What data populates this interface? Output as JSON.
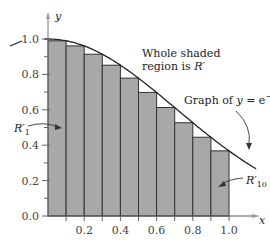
{
  "chart_data": {
    "type": "bar",
    "title": "",
    "xlabel": "x",
    "ylabel": "y",
    "xlim": [
      0,
      1.0
    ],
    "ylim": [
      0,
      1.0
    ],
    "x_ticks": [
      "0.2",
      "0.4",
      "0.6",
      "0.8",
      "1.0"
    ],
    "y_ticks": [
      "0.0",
      "0.2",
      "0.4",
      "0.6",
      "0.8",
      "1.0"
    ],
    "grid": false,
    "curve": {
      "label": "Graph of y = e^{-x^2}",
      "function": "exp(-x^2)"
    },
    "categories": [
      "0.0-0.1",
      "0.1-0.2",
      "0.2-0.3",
      "0.3-0.4",
      "0.4-0.5",
      "0.5-0.6",
      "0.6-0.7",
      "0.7-0.8",
      "0.8-0.9",
      "0.9-1.0"
    ],
    "values": [
      0.99,
      0.961,
      0.914,
      0.852,
      0.779,
      0.698,
      0.613,
      0.527,
      0.445,
      0.368
    ],
    "annotations": [
      {
        "text": "Whole shaded region is R'",
        "target": "all rectangles"
      },
      {
        "text": "Graph of y = e^{-x^2}",
        "target": "curve"
      },
      {
        "text": "R'_1",
        "target": "first rectangle"
      },
      {
        "text": "R'_10",
        "target": "last rectangle"
      }
    ]
  },
  "labels": {
    "x_axis": "x",
    "y_axis": "y",
    "region_line1": "Whole shaded",
    "region_line2": "region is ",
    "region_R": "R′",
    "graph_prefix": "Graph of ",
    "graph_y": "y",
    "graph_eq": " = e",
    "graph_exp": "−x²",
    "r1": "R′",
    "r1_sub": "1",
    "r10": "R′",
    "r10_sub": "10"
  },
  "colors": {
    "bar_fill": "#a8a8a8",
    "bar_stroke": "#333333",
    "axis": "#555555",
    "curve": "#222222"
  }
}
